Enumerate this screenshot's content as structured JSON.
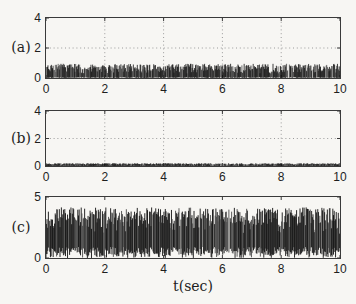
{
  "colors": {
    "background": "#f7f6f3",
    "axis": "#3a3a3a",
    "signal_dark": "#101010",
    "signal_mid": "#4a4a4a",
    "grid": "#9a9a9a",
    "text": "#1e1e1e"
  },
  "chart_data": {
    "type": "line",
    "title": "",
    "xlabel": "t(sec)",
    "x_range": [
      0,
      10
    ],
    "xticks": [
      "0",
      "2",
      "4",
      "6",
      "8",
      "10"
    ],
    "legend": null,
    "subplots": [
      {
        "panel_label": "(a)",
        "ylim": [
          0,
          4
        ],
        "yticks": [
          "0",
          "2",
          "4"
        ],
        "grid": true,
        "signal": {
          "kind": "dense random noise band oscillating between 0 and ~0.9",
          "seed": 7,
          "n": 520,
          "baseline": 0,
          "peak_min": 0.35,
          "peak_max": 0.95,
          "lo_max": 0.06,
          "gap_prob": 0.12
        }
      },
      {
        "panel_label": "(b)",
        "ylim": [
          0,
          4
        ],
        "yticks": [
          "0",
          "2",
          "4"
        ],
        "grid": true,
        "signal": {
          "kind": "low-amplitude noise band hugging zero (0 to ~0.2)",
          "seed": 13,
          "n": 560,
          "baseline": 0,
          "peak_min": 0.08,
          "peak_max": 0.2,
          "lo_max": 0.02,
          "gap_prob": 0.1
        }
      },
      {
        "panel_label": "(c)",
        "ylim": [
          0,
          5
        ],
        "yticks": [
          "0",
          "5"
        ],
        "grid": false,
        "signal": {
          "kind": "dense random telegraph-like noise filling 0 to ~4.1",
          "seed": 29,
          "n": 430,
          "baseline": 0,
          "peak_min": 2.3,
          "peak_max": 4.15,
          "lo_max": 0.9,
          "gap_prob": 0.07
        }
      }
    ]
  }
}
